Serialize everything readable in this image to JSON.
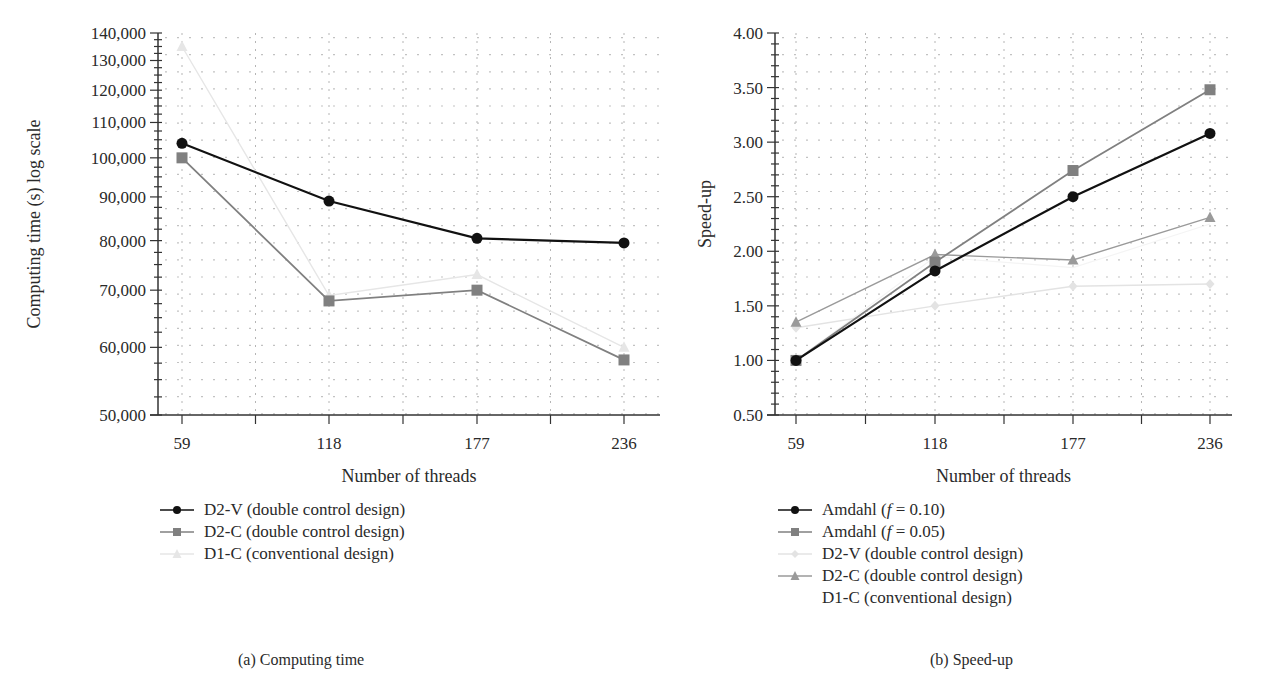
{
  "figure": {
    "panel_a": {
      "caption": "(a)  Computing time",
      "ylabel": "Computing time (s) log scale",
      "xlabel": "Number of threads",
      "yticks": [
        "140,000",
        "130,000",
        "120,000",
        "110,000",
        "100,000",
        "90,000",
        "80,000",
        "70,000",
        "60,000",
        "50,000"
      ],
      "xticks": [
        "59",
        "118",
        "177",
        "236"
      ],
      "legend": [
        {
          "label": "D2-V (double control design)",
          "marker": "circle",
          "color": "#111111"
        },
        {
          "label": "D2-C (double control design)",
          "marker": "square",
          "color": "#808080"
        },
        {
          "label": "D1-C (conventional design)",
          "marker": "triangle",
          "color": "#e6e6e6"
        }
      ]
    },
    "panel_b": {
      "caption": "(b)  Speed-up",
      "ylabel": "Speed-up",
      "xlabel": "Number of threads",
      "yticks": [
        "4.00",
        "3.50",
        "3.00",
        "2.50",
        "2.00",
        "1.50",
        "1.00",
        "0.50"
      ],
      "xticks": [
        "59",
        "118",
        "177",
        "236"
      ],
      "legend": [
        {
          "label": "Amdahl (f = 0.10)",
          "prefix": "Amdahl (",
          "italic": "f",
          "suffix": " = 0.10)",
          "marker": "circle",
          "color": "#111111"
        },
        {
          "label": "Amdahl (f = 0.05)",
          "prefix": "Amdahl (",
          "italic": "f",
          "suffix": " = 0.05)",
          "marker": "square",
          "color": "#808080"
        },
        {
          "label": "D2-V (double control design)",
          "marker": "diamond",
          "color": "#e3e3e3"
        },
        {
          "label": "D2-C (double control design)",
          "marker": "triangle",
          "color": "#9a9a9a"
        },
        {
          "label": "D1-C (conventional design)",
          "marker": "none",
          "color": "#f4f4f4"
        }
      ]
    }
  },
  "chart_data": [
    {
      "type": "line",
      "title": "(a) Computing time",
      "xlabel": "Number of threads",
      "ylabel": "Computing time (s) log scale",
      "yscale": "log",
      "ylim": [
        50000,
        140000
      ],
      "grid": true,
      "legend_position": "bottom",
      "x": [
        59,
        118,
        177,
        236
      ],
      "series": [
        {
          "name": "D2-V (double control design)",
          "values": [
            104000,
            89000,
            80500,
            79500
          ]
        },
        {
          "name": "D2-C (double control design)",
          "values": [
            100000,
            68000,
            70000,
            58000
          ]
        },
        {
          "name": "D1-C (conventional design)",
          "values": [
            135000,
            69000,
            73000,
            60000
          ]
        }
      ]
    },
    {
      "type": "line",
      "title": "(b) Speed-up",
      "xlabel": "Number of threads",
      "ylabel": "Speed-up",
      "ylim": [
        0.5,
        4.0
      ],
      "grid": true,
      "legend_position": "bottom",
      "x": [
        59,
        118,
        177,
        236
      ],
      "series": [
        {
          "name": "Amdahl (f = 0.10)",
          "values": [
            1.0,
            1.82,
            2.5,
            3.08
          ]
        },
        {
          "name": "Amdahl (f = 0.05)",
          "values": [
            1.0,
            1.9,
            2.74,
            3.48
          ]
        },
        {
          "name": "D2-V (double control design)",
          "values": [
            1.3,
            1.5,
            1.68,
            1.7
          ]
        },
        {
          "name": "D2-C (double control design)",
          "values": [
            1.35,
            1.97,
            1.92,
            2.31
          ]
        },
        {
          "name": "D1-C (conventional design)",
          "values": [
            1.0,
            1.95,
            1.85,
            2.25
          ]
        }
      ]
    }
  ]
}
